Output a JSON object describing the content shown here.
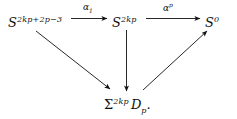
{
  "figure": {
    "type": "commutative-diagram",
    "background_color": "#ffffff",
    "ink_color": "#111111",
    "width": 237,
    "height": 119
  },
  "nodes": {
    "source": {
      "name": "S^{2kp+2p-3}",
      "base": "S",
      "exponent": "2kp+2p−3"
    },
    "middle": {
      "name": "S^{2kp}",
      "base": "S",
      "exponent": "2kp"
    },
    "target": {
      "name": "S^0",
      "base": "S",
      "exponent": "0"
    },
    "bottom": {
      "name": "Σ^{2kp} D_p.",
      "base": "Σ",
      "exponent": "2kp",
      "object": "D",
      "subscript": "p",
      "punctuation": "."
    }
  },
  "arrow_labels": {
    "alpha_1": {
      "base": "α",
      "subscript": "1"
    },
    "alpha_p": {
      "base": "α",
      "exponent": "p"
    }
  },
  "arrows": [
    {
      "name": "arrow-source-to-middle",
      "from": "source",
      "to": "middle",
      "direction": "right",
      "label": "alpha_1"
    },
    {
      "name": "arrow-middle-to-target",
      "from": "middle",
      "to": "target",
      "direction": "right",
      "label": "alpha_p"
    },
    {
      "name": "arrow-source-to-bottom",
      "from": "source",
      "to": "bottom",
      "direction": "down-right",
      "label": null
    },
    {
      "name": "arrow-middle-to-bottom",
      "from": "middle",
      "to": "bottom",
      "direction": "down",
      "label": null
    },
    {
      "name": "arrow-bottom-to-target",
      "from": "bottom",
      "to": "target",
      "direction": "up-right",
      "label": null
    }
  ]
}
